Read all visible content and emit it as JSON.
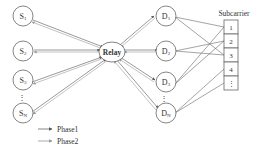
{
  "diagram": {
    "relay": {
      "label": "Relay"
    },
    "sources": [
      {
        "label": "S",
        "sub": "1"
      },
      {
        "label": "S",
        "sub": "2"
      },
      {
        "label": "S",
        "sub": "3"
      },
      {
        "label": "S",
        "sub": "N"
      }
    ],
    "destinations": [
      {
        "label": "D",
        "sub": "1"
      },
      {
        "label": "D",
        "sub": "2"
      },
      {
        "label": "D",
        "sub": "3"
      },
      {
        "label": "D",
        "sub": "N"
      }
    ],
    "ellipsis": "⋮",
    "subcarrier": {
      "title": "Subcarrier",
      "cells": [
        "1",
        "2",
        "3",
        "4",
        "⋮"
      ]
    },
    "legend": [
      {
        "label": "Phase1",
        "color": "#555555"
      },
      {
        "label": "Phase2",
        "color": "#888888"
      }
    ],
    "colors": {
      "line_phase1": "#555555",
      "line_phase2": "#999999",
      "node_stroke": "#666666",
      "text": "#333333"
    }
  }
}
